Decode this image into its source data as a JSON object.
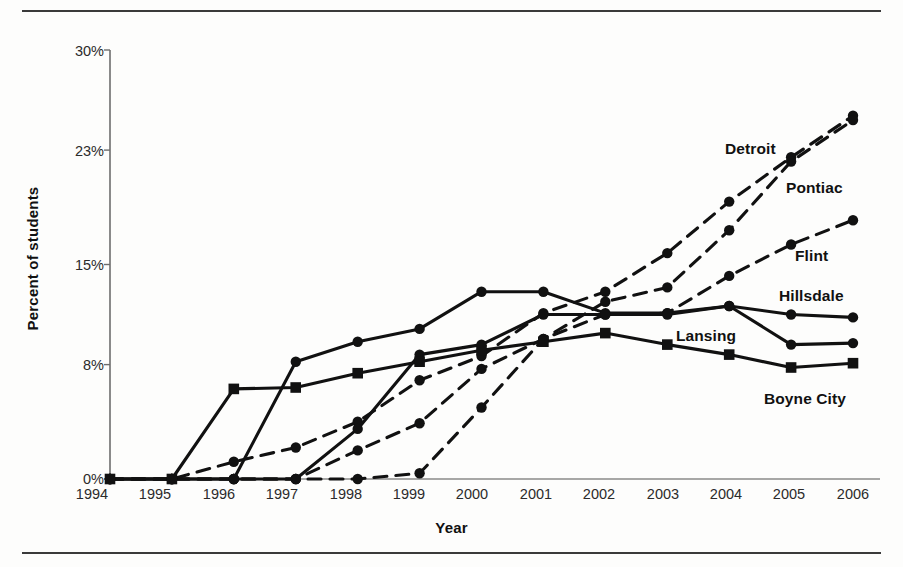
{
  "figure": {
    "background_color": "#fdfdfc",
    "line_color": "#111111",
    "rule_color": "#3a3a3a"
  },
  "chart_data": {
    "type": "line",
    "title": "",
    "xlabel": "Year",
    "ylabel": "Percent of students",
    "x": [
      1994,
      1995,
      1996,
      1997,
      1998,
      1999,
      2000,
      2001,
      2002,
      2003,
      2004,
      2005,
      2006
    ],
    "categories": [
      "1994",
      "1995",
      "1996",
      "1997",
      "1998",
      "1999",
      "2000",
      "2001",
      "2002",
      "2003",
      "2004",
      "2005",
      "2006"
    ],
    "xtick_labels": [
      "1994",
      "1995",
      "1996",
      "1997",
      "1998",
      "1999",
      "2000",
      "2001",
      "2002",
      "2003",
      "2004",
      "2005",
      "2006"
    ],
    "ytick_labels": [
      "0%",
      "8%",
      "15%",
      "23%",
      "30%"
    ],
    "ytick_values": [
      0,
      8,
      15,
      23,
      30
    ],
    "ylim": [
      0,
      30
    ],
    "xlim": [
      1994,
      2006
    ],
    "grid": false,
    "legend_position": "inline-right-labels",
    "series": [
      {
        "name": "Detroit",
        "style": "dashed",
        "marker": "circle",
        "values": [
          0,
          0,
          1.2,
          2.2,
          4.0,
          6.9,
          8.6,
          11.6,
          13.1,
          15.8,
          19.4,
          22.5,
          25.4
        ]
      },
      {
        "name": "Pontiac",
        "style": "dashed",
        "marker": "circle",
        "values": [
          0,
          0,
          0,
          0,
          0,
          0.4,
          5.0,
          9.8,
          12.4,
          13.4,
          17.4,
          22.2,
          25.1
        ]
      },
      {
        "name": "Flint",
        "style": "dashed",
        "marker": "circle",
        "values": [
          0,
          0,
          0,
          0,
          2.0,
          3.9,
          7.7,
          9.8,
          11.5,
          11.6,
          14.2,
          16.4,
          18.1
        ]
      },
      {
        "name": "Hillsdale",
        "style": "solid",
        "marker": "circle",
        "values": [
          0,
          0,
          0,
          8.2,
          9.6,
          10.5,
          13.1,
          13.1,
          11.6,
          11.6,
          12.1,
          11.5,
          11.3
        ]
      },
      {
        "name": "Lansing",
        "style": "solid",
        "marker": "circle",
        "values": [
          0,
          0,
          0,
          0,
          3.5,
          8.7,
          9.4,
          11.5,
          11.5,
          11.5,
          12.1,
          9.4,
          9.5
        ]
      },
      {
        "name": "Boyne City",
        "style": "solid",
        "marker": "square",
        "values": [
          0,
          0,
          6.3,
          6.4,
          7.4,
          8.2,
          9.0,
          9.6,
          10.2,
          9.4,
          8.7,
          7.8,
          8.1
        ]
      }
    ],
    "series_labels": [
      {
        "name": "Detroit",
        "text": "Detroit"
      },
      {
        "name": "Pontiac",
        "text": "Pontiac"
      },
      {
        "name": "Flint",
        "text": "Flint"
      },
      {
        "name": "Hillsdale",
        "text": "Hillsdale"
      },
      {
        "name": "Lansing",
        "text": "Lansing"
      },
      {
        "name": "Boyne City",
        "text": "Boyne City"
      }
    ]
  },
  "labels": {
    "y_axis_title": "Percent of students",
    "x_axis_title": "Year",
    "detroit": "Detroit",
    "pontiac": "Pontiac",
    "flint": "Flint",
    "hillsdale": "Hillsdale",
    "lansing": "Lansing",
    "boyne_city": "Boyne City",
    "y0": "0%",
    "y1": "8%",
    "y2": "15%",
    "y3": "23%",
    "y4": "30%",
    "x1994": "1994",
    "x1995": "1995",
    "x1996": "1996",
    "x1997": "1997",
    "x1998": "1998",
    "x1999": "1999",
    "x2000": "2000",
    "x2001": "2001",
    "x2002": "2002",
    "x2003": "2003",
    "x2004": "2004",
    "x2005": "2005",
    "x2006": "2006"
  }
}
